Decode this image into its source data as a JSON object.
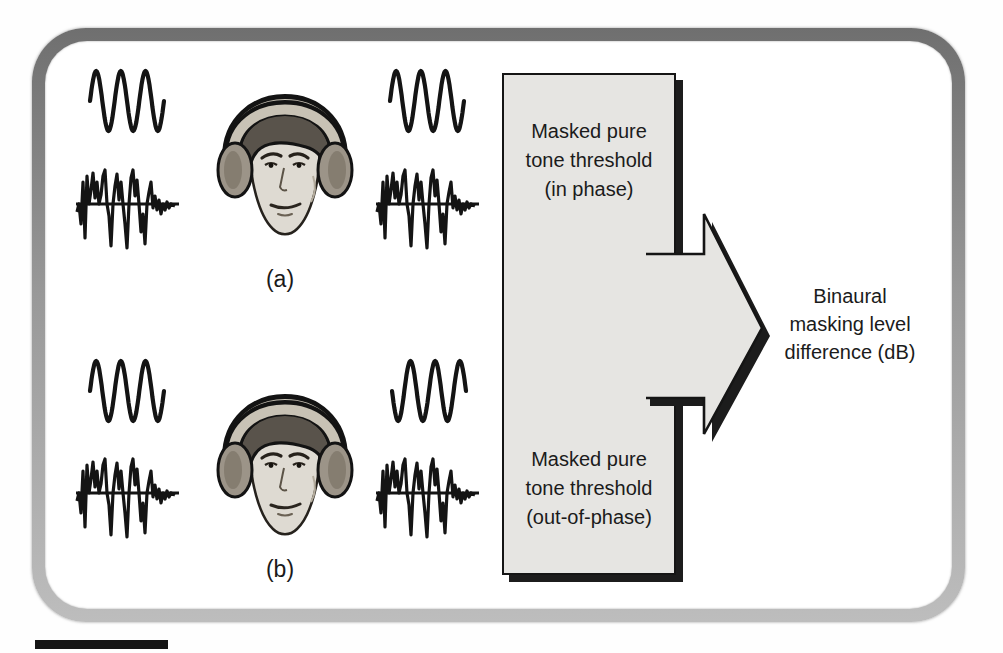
{
  "figure": {
    "panel_a_label": "(a)",
    "panel_b_label": "(b)",
    "flow_box": {
      "top": [
        "Masked pure",
        "tone threshold",
        "(in phase)"
      ],
      "bottom": [
        "Masked pure",
        "tone threshold",
        "(out-of-phase)"
      ]
    },
    "output": [
      "Binaural",
      "masking level",
      "difference (dB)"
    ]
  },
  "colors": {
    "ink": "#1a1a1a",
    "box_fill": "#e6e5e2",
    "shadow_dark": "#1c1c1c"
  }
}
